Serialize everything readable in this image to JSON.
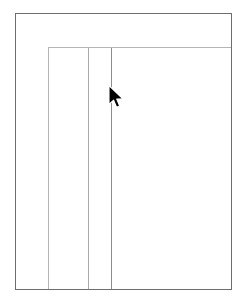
{
  "window": {
    "background_color": "#ffffff",
    "frame_border_color": "#6e6e6e",
    "frame": {
      "x": 15,
      "y": 13,
      "width": 217,
      "height": 277
    }
  },
  "panel": {
    "border_color": "#b4b4b4",
    "background_color": "#ffffff",
    "frame": {
      "x": 48,
      "y": 47,
      "width": 183,
      "height": 242
    }
  },
  "columns": [
    {
      "name": "column-divider-1",
      "x": 87,
      "color": "#aaaaaa",
      "emphasis": "normal"
    },
    {
      "name": "column-divider-2",
      "x": 110,
      "color": "#8d8d8d",
      "emphasis": "strong"
    }
  ],
  "cursor": {
    "type": "arrow-pointer",
    "color": "#000000",
    "outline_color": "#ffffff",
    "tip_x": 109,
    "tip_y": 86
  }
}
